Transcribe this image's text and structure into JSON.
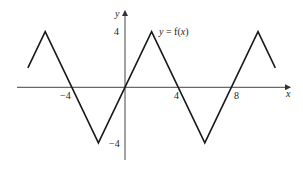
{
  "chart_data": {
    "type": "line",
    "title": "",
    "function_label": "y = f(x)",
    "xlabel": "x",
    "ylabel": "y",
    "x_ticks": [
      -4,
      4,
      8
    ],
    "y_ticks": [
      4,
      -4
    ],
    "xlim": [
      -8,
      12
    ],
    "ylim": [
      -6,
      6
    ],
    "grid": false,
    "series": [
      {
        "name": "f(x)",
        "points": [
          [
            -7.3,
            1.4
          ],
          [
            -6,
            4
          ],
          [
            -2,
            -4
          ],
          [
            2,
            4
          ],
          [
            6,
            -4
          ],
          [
            10,
            4
          ],
          [
            11.3,
            1.4
          ]
        ]
      }
    ]
  },
  "labels": {
    "x_axis": "x",
    "y_axis": "y",
    "function": "y = f(x)",
    "tick_x_neg4": "−4",
    "tick_x_4": "4",
    "tick_x_8": "8",
    "tick_y_4": "4",
    "tick_y_neg4": "−4"
  }
}
